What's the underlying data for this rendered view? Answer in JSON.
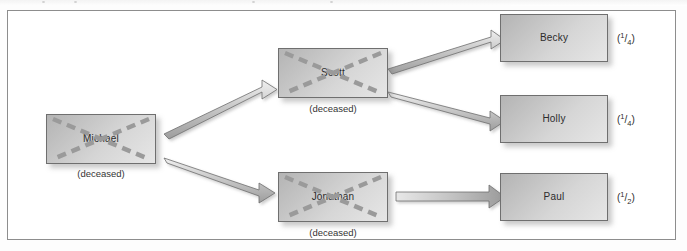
{
  "figure": {
    "type": "inheritance-distribution-tree",
    "deceased_note": "(deceased)"
  },
  "nodes": [
    {
      "id": "michael",
      "label": "Michael",
      "deceased": true,
      "note": "(deceased)",
      "share": null
    },
    {
      "id": "scott",
      "label": "Scott",
      "deceased": true,
      "note": "(deceased)",
      "share": null
    },
    {
      "id": "jonathan",
      "label": "Jonathan",
      "deceased": true,
      "note": "(deceased)",
      "share": null
    },
    {
      "id": "becky",
      "label": "Becky",
      "deceased": false,
      "note": null,
      "share": {
        "numerator": "1",
        "slash": "/",
        "denominator": "4"
      }
    },
    {
      "id": "holly",
      "label": "Holly",
      "deceased": false,
      "note": null,
      "share": {
        "numerator": "1",
        "slash": "/",
        "denominator": "4"
      }
    },
    {
      "id": "paul",
      "label": "Paul",
      "deceased": false,
      "note": null,
      "share": {
        "numerator": "1",
        "slash": "/",
        "denominator": "2"
      }
    }
  ],
  "edges": [
    {
      "from": "michael",
      "to": "scott"
    },
    {
      "from": "michael",
      "to": "jonathan"
    },
    {
      "from": "scott",
      "to": "becky"
    },
    {
      "from": "scott",
      "to": "holly"
    },
    {
      "from": "jonathan",
      "to": "paul"
    }
  ],
  "colors": {
    "box_border": "#6f6f6f",
    "box_fill_dark": "#b4b4b4",
    "box_fill_light": "#e6e6e6",
    "strike": "#9a9a9a",
    "arrow_border": "#6f6f6f",
    "frame": "#8d8d8d",
    "text": "#2c2c2c"
  }
}
